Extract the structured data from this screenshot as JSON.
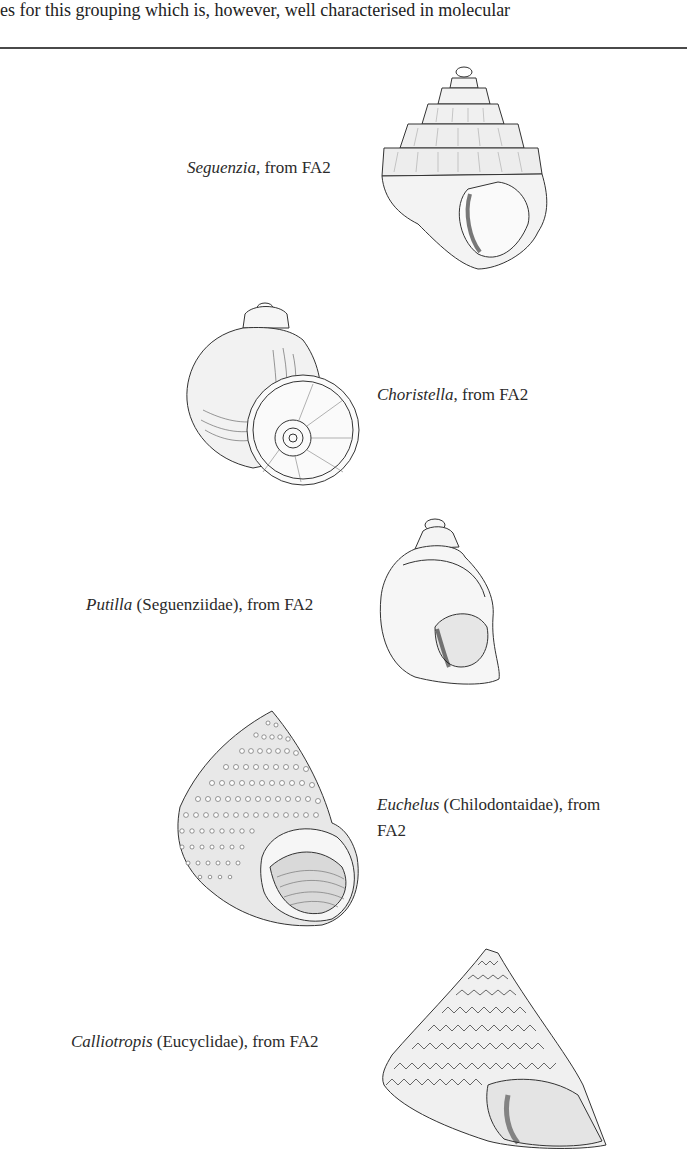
{
  "page": {
    "running_text": "es for this grouping which is, however, well characterised in molecular"
  },
  "figures": [
    {
      "genus": "Seguenzia",
      "rest": ", from FA2",
      "shell_type": "turreted-carinate-shell"
    },
    {
      "genus": "Choristella",
      "rest": ", from FA2",
      "shell_type": "globose-umbilicate-shell"
    },
    {
      "genus": "Putilla",
      "rest": " (Seguenziidae), from FA2",
      "shell_type": "smooth-ovate-shell"
    },
    {
      "genus": "Euchelus",
      "rest": " (Chilodontaidae), from",
      "rest_line2": "FA2",
      "shell_type": "beaded-turbinate-shell"
    },
    {
      "genus": "Calliotropis",
      "rest": " (Eucyclidae), from FA2",
      "shell_type": "conical-nodulose-shell"
    }
  ],
  "colors": {
    "ink": "#222222",
    "rule": "#4a4a4a",
    "background": "#ffffff"
  }
}
